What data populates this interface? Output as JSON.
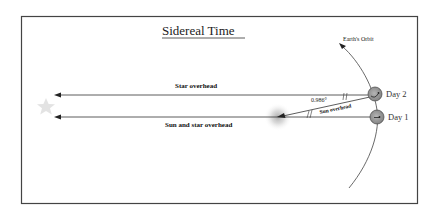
{
  "title": "Sidereal Time",
  "orbit_label": "Earth's Orbit",
  "rays": {
    "star_overhead": "Star overhead",
    "sun_and_star_overhead": "Sun and star overhead",
    "sun_overhead": "Sun overhead"
  },
  "angle_label": "0.986°",
  "days": {
    "day2": "Day 2",
    "day1": "Day 1"
  },
  "colors": {
    "frame": "#444444",
    "line": "#333333",
    "earth_fill": "#9a9a9a",
    "star": "#d8d8d8",
    "sun_glow": "#bdbdbd"
  }
}
